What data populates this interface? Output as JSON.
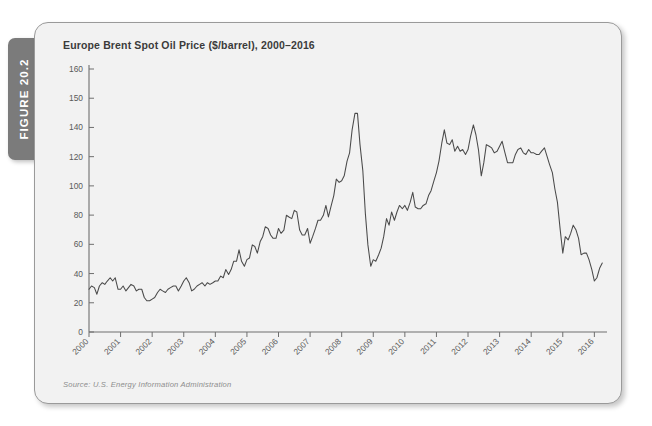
{
  "page": {
    "ghost_text": "                                                                                                                                            ",
    "figure_tab_label": "FIGURE 20.2"
  },
  "figure": {
    "title": "Europe Brent Spot Oil Price ($/barrel), 2000–2016",
    "source": "Source: U.S. Energy Information Administration",
    "accent_color": "#7b7b7b",
    "panel_bg": "#f2f2f2",
    "line_color": "#4a4a4a",
    "axis_color": "#6f6f6f"
  },
  "chart_data": {
    "type": "line",
    "title": "Europe Brent Spot Oil Price ($/barrel), 2000–2016",
    "subtitle": "",
    "xlabel": "",
    "ylabel": "",
    "grid": false,
    "legend": false,
    "legend_position": "none",
    "xlim": [
      2000,
      2016.4
    ],
    "ylim": [
      0,
      160
    ],
    "ytick_labels": [
      "160",
      "150",
      "140",
      "120",
      "100",
      "80",
      "60",
      "40",
      "20",
      "0"
    ],
    "ytick_values": [
      160,
      150,
      140,
      120,
      100,
      80,
      60,
      40,
      20,
      0
    ],
    "xtick_labels": [
      "2000",
      "2001",
      "2002",
      "2003",
      "2004",
      "2005",
      "2006",
      "2007",
      "2008",
      "2009",
      "2010",
      "2011",
      "2012",
      "2013",
      "2014",
      "2015",
      "2016"
    ],
    "xtick_values": [
      2000,
      2001,
      2002,
      2003,
      2004,
      2005,
      2006,
      2007,
      2008,
      2009,
      2010,
      2011,
      2012,
      2013,
      2014,
      2015,
      2016
    ],
    "series": [
      {
        "name": "Europe Brent Spot Oil Price",
        "units": "$/barrel",
        "x": [
          2000.0,
          2000.08,
          2000.17,
          2000.25,
          2000.33,
          2000.42,
          2000.5,
          2000.58,
          2000.67,
          2000.75,
          2000.83,
          2000.92,
          2001.0,
          2001.08,
          2001.17,
          2001.25,
          2001.33,
          2001.42,
          2001.5,
          2001.58,
          2001.67,
          2001.75,
          2001.83,
          2001.92,
          2002.0,
          2002.08,
          2002.17,
          2002.25,
          2002.33,
          2002.42,
          2002.5,
          2002.58,
          2002.67,
          2002.75,
          2002.83,
          2002.92,
          2003.0,
          2003.08,
          2003.17,
          2003.25,
          2003.33,
          2003.42,
          2003.5,
          2003.58,
          2003.67,
          2003.75,
          2003.83,
          2003.92,
          2004.0,
          2004.08,
          2004.17,
          2004.25,
          2004.33,
          2004.42,
          2004.5,
          2004.58,
          2004.67,
          2004.75,
          2004.83,
          2004.92,
          2005.0,
          2005.08,
          2005.17,
          2005.25,
          2005.33,
          2005.42,
          2005.5,
          2005.58,
          2005.67,
          2005.75,
          2005.83,
          2005.92,
          2006.0,
          2006.08,
          2006.17,
          2006.25,
          2006.33,
          2006.42,
          2006.5,
          2006.58,
          2006.67,
          2006.75,
          2006.83,
          2006.92,
          2007.0,
          2007.08,
          2007.17,
          2007.25,
          2007.33,
          2007.42,
          2007.5,
          2007.58,
          2007.67,
          2007.75,
          2007.83,
          2007.92,
          2008.0,
          2008.08,
          2008.17,
          2008.25,
          2008.33,
          2008.42,
          2008.5,
          2008.58,
          2008.67,
          2008.75,
          2008.83,
          2008.92,
          2009.0,
          2009.08,
          2009.17,
          2009.25,
          2009.33,
          2009.42,
          2009.5,
          2009.58,
          2009.67,
          2009.75,
          2009.83,
          2009.92,
          2010.0,
          2010.08,
          2010.17,
          2010.25,
          2010.33,
          2010.42,
          2010.5,
          2010.58,
          2010.67,
          2010.75,
          2010.83,
          2010.92,
          2011.0,
          2011.08,
          2011.17,
          2011.25,
          2011.33,
          2011.42,
          2011.5,
          2011.58,
          2011.67,
          2011.75,
          2011.83,
          2011.92,
          2012.0,
          2012.08,
          2012.17,
          2012.25,
          2012.33,
          2012.42,
          2012.5,
          2012.58,
          2012.67,
          2012.75,
          2012.83,
          2012.92,
          2013.0,
          2013.08,
          2013.17,
          2013.25,
          2013.33,
          2013.42,
          2013.5,
          2013.58,
          2013.67,
          2013.75,
          2013.83,
          2013.92,
          2014.0,
          2014.08,
          2014.17,
          2014.25,
          2014.33,
          2014.42,
          2014.5,
          2014.58,
          2014.67,
          2014.75,
          2014.83,
          2014.92,
          2015.0,
          2015.08,
          2015.17,
          2015.25,
          2015.33,
          2015.42,
          2015.5,
          2015.58,
          2015.67,
          2015.75,
          2015.83,
          2015.92,
          2016.0,
          2016.08,
          2016.17,
          2016.25
        ],
        "values": [
          26,
          28,
          27,
          23,
          28,
          30,
          29,
          31,
          33,
          31,
          33,
          26,
          26,
          28,
          25,
          27,
          29,
          28,
          25,
          26,
          26,
          21,
          19,
          19,
          20,
          21,
          24,
          26,
          25,
          24,
          26,
          27,
          28,
          28,
          25,
          28,
          31,
          33,
          30,
          25,
          26,
          28,
          29,
          30,
          28,
          30,
          29,
          30,
          31,
          31,
          34,
          33,
          38,
          35,
          38,
          43,
          43,
          50,
          43,
          40,
          44,
          45,
          53,
          52,
          48,
          55,
          58,
          64,
          63,
          59,
          57,
          57,
          63,
          60,
          62,
          71,
          70,
          69,
          74,
          73,
          62,
          59,
          59,
          63,
          54,
          58,
          63,
          68,
          68,
          71,
          77,
          70,
          77,
          83,
          93,
          91,
          92,
          95,
          104,
          109,
          123,
          133,
          133,
          114,
          98,
          72,
          53,
          40,
          44,
          43,
          47,
          51,
          58,
          69,
          65,
          73,
          68,
          73,
          77,
          75,
          77,
          74,
          79,
          85,
          76,
          75,
          75,
          77,
          78,
          83,
          86,
          92,
          97,
          104,
          115,
          123,
          115,
          114,
          117,
          110,
          113,
          110,
          111,
          108,
          111,
          119,
          126,
          120,
          111,
          95,
          103,
          114,
          113,
          112,
          109,
          110,
          113,
          116,
          109,
          103,
          103,
          103,
          108,
          111,
          112,
          109,
          108,
          111,
          109,
          109,
          108,
          108,
          110,
          112,
          107,
          102,
          97,
          87,
          79,
          62,
          48,
          58,
          56,
          60,
          65,
          62,
          57,
          47,
          48,
          48,
          44,
          38,
          31,
          33,
          39,
          42
        ]
      }
    ]
  }
}
